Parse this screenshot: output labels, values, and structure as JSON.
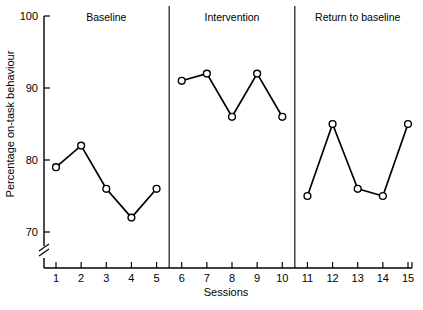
{
  "chart_data": {
    "type": "line",
    "title": "",
    "xlabel": "Sessions",
    "ylabel": "Percentage on-task behaviour",
    "x": [
      1,
      2,
      3,
      4,
      5,
      6,
      7,
      8,
      9,
      10,
      11,
      12,
      13,
      14,
      15
    ],
    "xtick_labels": [
      "1",
      "2",
      "3",
      "4",
      "5",
      "6",
      "7",
      "8",
      "9",
      "10",
      "11",
      "12",
      "13",
      "14",
      "15"
    ],
    "ytick_labels": [
      "70",
      "80",
      "90",
      "100"
    ],
    "yticks": [
      70,
      80,
      90,
      100
    ],
    "ylim": [
      70,
      100
    ],
    "xlim": [
      0.5,
      15.5
    ],
    "grid": false,
    "legend": null,
    "axis_break": true,
    "marker": "open-circle",
    "series": [
      {
        "name": "Baseline",
        "x": [
          1,
          2,
          3,
          4,
          5
        ],
        "values": [
          79,
          82,
          76,
          72,
          76
        ]
      },
      {
        "name": "Intervention",
        "x": [
          6,
          7,
          8,
          9,
          10
        ],
        "values": [
          91,
          92,
          86,
          92,
          86
        ]
      },
      {
        "name": "Return to baseline",
        "x": [
          11,
          12,
          13,
          14,
          15
        ],
        "values": [
          75,
          85,
          76,
          75,
          85
        ]
      }
    ],
    "phases": [
      {
        "label": "Baseline",
        "start": 1,
        "end": 5,
        "label_x": 3
      },
      {
        "label": "Intervention",
        "start": 6,
        "end": 10,
        "label_x": 8
      },
      {
        "label": "Return to baseline",
        "start": 11,
        "end": 15,
        "label_x": 13
      }
    ],
    "phase_dividers": [
      5.5,
      10.5
    ],
    "annotations": []
  }
}
